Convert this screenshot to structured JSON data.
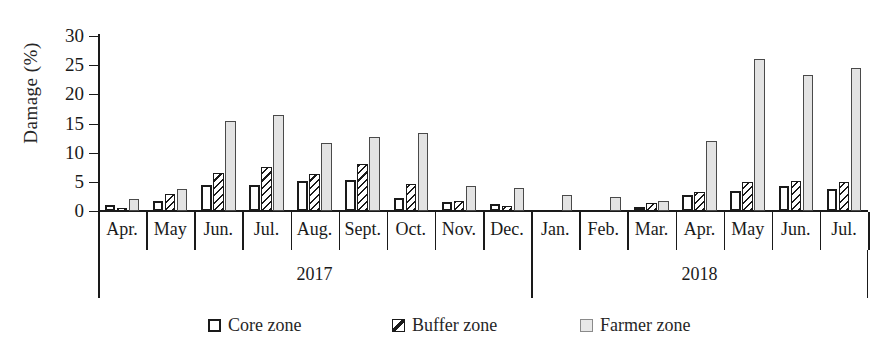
{
  "chart_data": {
    "type": "bar",
    "title": "",
    "xlabel": "",
    "ylabel": "Damage (%)",
    "ylim": [
      0,
      30
    ],
    "yticks": [
      0,
      5,
      10,
      15,
      20,
      25,
      30
    ],
    "grid": false,
    "legend_position": "bottom",
    "categories": [
      "Apr.",
      "May",
      "Jun.",
      "Jul.",
      "Aug.",
      "Sept.",
      "Oct.",
      "Nov.",
      "Dec.",
      "Jan.",
      "Feb.",
      "Mar.",
      "Apr.",
      "May",
      "Jun.",
      "Jul."
    ],
    "group_labels": [
      {
        "label": "2017",
        "start_index": 0,
        "end_index": 8
      },
      {
        "label": "2018",
        "start_index": 9,
        "end_index": 15
      }
    ],
    "series": [
      {
        "name": "Core zone",
        "pattern": "solid-white",
        "color": "#ffffff",
        "values": [
          1.0,
          1.8,
          4.5,
          4.4,
          5.2,
          5.3,
          2.2,
          1.5,
          1.2,
          0.0,
          0.0,
          0.7,
          2.7,
          3.4,
          4.3,
          3.7
        ]
      },
      {
        "name": "Buffer zone",
        "pattern": "diagonal-hatch",
        "color": "#1a1a1a",
        "values": [
          0.6,
          2.9,
          6.5,
          7.6,
          6.4,
          8.0,
          4.7,
          1.8,
          0.8,
          0.0,
          0.0,
          1.4,
          3.3,
          5.0,
          5.1,
          4.9
        ]
      },
      {
        "name": "Farmer zone",
        "pattern": "light-gray",
        "color": "#e3e3e3",
        "values": [
          2.1,
          3.7,
          15.5,
          16.5,
          11.7,
          12.7,
          13.3,
          4.3,
          4.0,
          2.7,
          2.4,
          1.8,
          12.0,
          26.0,
          23.4,
          24.5
        ]
      }
    ]
  },
  "legend": {
    "items": [
      {
        "label": "Core zone",
        "swatch": "core"
      },
      {
        "label": "Buffer zone",
        "swatch": "buffer"
      },
      {
        "label": "Farmer zone",
        "swatch": "farmer"
      }
    ]
  }
}
